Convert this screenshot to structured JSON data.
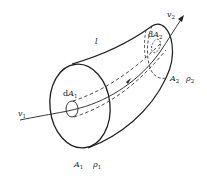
{
  "diagram": {
    "type": "stream-tube",
    "labels": {
      "tube_label": "l",
      "inlet_velocity": {
        "main": "v",
        "sub": "1"
      },
      "outlet_velocity": {
        "main": "v",
        "sub": "2"
      },
      "inlet_element_area": {
        "prefix": "d",
        "main": "A",
        "sub": "1"
      },
      "outlet_element_area": {
        "prefix": "d",
        "main": "A",
        "sub": "2"
      },
      "inlet_area": {
        "main": "A",
        "sub": "1"
      },
      "inlet_density": {
        "main": "ρ",
        "sub": "1"
      },
      "outlet_area": {
        "main": "A",
        "sub": "2"
      },
      "outlet_density": {
        "main": "ρ",
        "sub": "2"
      }
    },
    "colors": {
      "stroke": "#222222",
      "background": "#ffffff"
    }
  }
}
